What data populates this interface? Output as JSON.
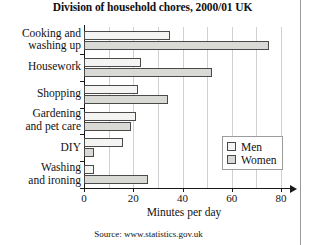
{
  "chart_data": {
    "type": "bar",
    "orientation": "horizontal",
    "title": "Division of household chores, 2000/01 UK",
    "xlabel": "Minutes per day",
    "ylabel": "",
    "categories": [
      "Cooking and\nwashing up",
      "Housework",
      "Shopping",
      "Gardening\nand pet care",
      "DIY",
      "Washing\nand ironing"
    ],
    "series": [
      {
        "name": "Men",
        "values": [
          35,
          23,
          22,
          21,
          16,
          4
        ],
        "color": "#f4f4f2"
      },
      {
        "name": "Women",
        "values": [
          75,
          52,
          34,
          19,
          4,
          26
        ],
        "color": "#d9d9d6"
      }
    ],
    "xlim": [
      0,
      80
    ],
    "xticks": [
      0,
      20,
      40,
      60,
      80
    ],
    "xtick_labels": [
      "0",
      "20",
      "40",
      "60",
      "80"
    ],
    "grid": "vertical",
    "legend_position": "right-inside",
    "source": "Source: www.statistics.gov.uk"
  },
  "legend": {
    "entries": [
      {
        "label": "Men"
      },
      {
        "label": "Women"
      }
    ]
  },
  "footer": {
    "source": "Source: www.statistics.gov.uk"
  }
}
